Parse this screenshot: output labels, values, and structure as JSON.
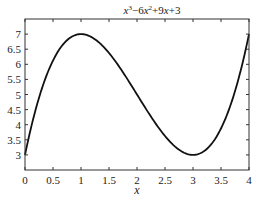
{
  "chart_data": {
    "type": "line",
    "title_parts": [
      "x",
      "3",
      "−6",
      "x",
      "2",
      "+9",
      "x",
      "+3"
    ],
    "xlabel": "x",
    "ylabel": "",
    "xlim": [
      0,
      4
    ],
    "ylim": [
      2.5,
      7.5
    ],
    "xticks": [
      0,
      0.5,
      1,
      1.5,
      2,
      2.5,
      3,
      3.5,
      4
    ],
    "xtick_labels": [
      "0",
      "0.5",
      "1",
      "1.5",
      "2",
      "2.5",
      "3",
      "3.5",
      "4"
    ],
    "yticks": [
      3,
      3.5,
      4,
      4.5,
      5,
      5.5,
      6,
      6.5,
      7
    ],
    "ytick_labels": [
      "3",
      "3.5",
      "4",
      "4.5",
      "5",
      "5.5",
      "6",
      "6.5",
      "7"
    ],
    "grid": false,
    "legend": null,
    "series": [
      {
        "name": "x^3-6x^2+9x+3",
        "color": "#111111",
        "x": [
          0,
          0.25,
          0.5,
          0.75,
          1,
          1.25,
          1.5,
          1.75,
          2,
          2.25,
          2.5,
          2.75,
          3,
          3.25,
          3.5,
          3.75,
          4
        ],
        "y": [
          3,
          4.890625,
          6.125,
          6.796875,
          7,
          6.828125,
          6.375,
          5.734375,
          5,
          4.265625,
          3.625,
          3.171875,
          3,
          3.203125,
          3.875,
          5.109375,
          7
        ]
      }
    ]
  }
}
